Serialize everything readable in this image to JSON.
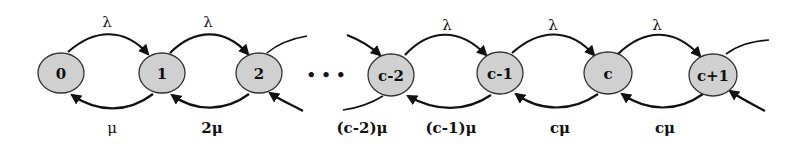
{
  "diagram": {
    "type": "birth-death-chain (M/M/c queue)",
    "nodes": [
      {
        "id": "0",
        "label": "0"
      },
      {
        "id": "1",
        "label": "1"
      },
      {
        "id": "2",
        "label": "2"
      },
      {
        "id": "c-2",
        "label": "c-2"
      },
      {
        "id": "c-1",
        "label": "c-1"
      },
      {
        "id": "c",
        "label": "c"
      },
      {
        "id": "c+1",
        "label": "c+1"
      }
    ],
    "ellipsis": "• • •",
    "arrival_labels": [
      "λ",
      "λ",
      "λ",
      "λ",
      "λ"
    ],
    "service_labels": [
      "μ",
      "2μ",
      "(c-2)μ",
      "(c-1)μ",
      "cμ",
      "cμ"
    ],
    "colors": {
      "node_fill": "#d0d0d0",
      "stroke": "#111111",
      "background": "#ffffff"
    }
  }
}
